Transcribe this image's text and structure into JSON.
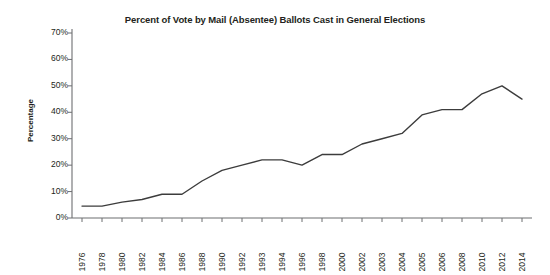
{
  "chart_data": {
    "type": "line",
    "title": "Percent of Vote by Mail (Absentee) Ballots Cast in General Elections",
    "xlabel": "",
    "ylabel": "Percentage",
    "ylim": [
      0,
      70
    ],
    "ytick_labels": [
      "70%",
      "60%",
      "50%",
      "40%",
      "30%",
      "20%",
      "10%",
      "0%"
    ],
    "ytick_values": [
      70,
      60,
      50,
      40,
      30,
      20,
      10,
      0
    ],
    "grid": false,
    "legend": "none",
    "line_color": "#3c3c3c",
    "categories": [
      "1976",
      "1978",
      "1980",
      "1982",
      "1984",
      "1986",
      "1988",
      "1990",
      "1992",
      "1993",
      "1994",
      "1996",
      "1998",
      "2000",
      "2002",
      "2003",
      "2004",
      "2005",
      "2006",
      "2008",
      "2010",
      "2012",
      "2014"
    ],
    "values": [
      4.5,
      4.5,
      6,
      7,
      9,
      9,
      14,
      18,
      20,
      22,
      22,
      20,
      24,
      24,
      28,
      30,
      32,
      39,
      41,
      41,
      47,
      50,
      45
    ],
    "series": [
      {
        "name": "Percent of vote by mail (absentee) ballots cast",
        "values": [
          4.5,
          4.5,
          6,
          7,
          9,
          9,
          14,
          18,
          20,
          22,
          22,
          20,
          24,
          24,
          28,
          30,
          32,
          39,
          41,
          41,
          47,
          50,
          45
        ]
      }
    ]
  }
}
